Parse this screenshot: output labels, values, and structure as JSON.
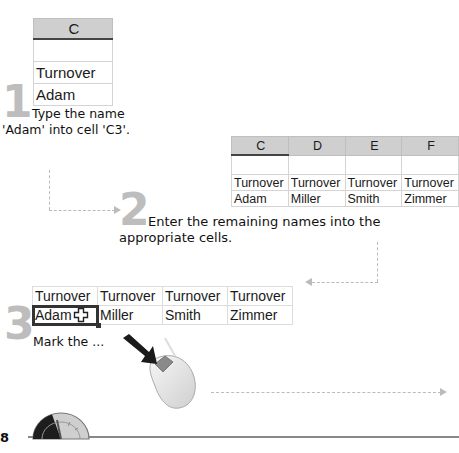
{
  "step1": {
    "number": "1",
    "sheet": {
      "column_header": "C",
      "rows": [
        "",
        "Turnover",
        "Adam"
      ]
    },
    "text_line1": "Type the name",
    "text_line2": "'Adam' into cell 'C3'."
  },
  "step2": {
    "number": "2",
    "sheet": {
      "column_headers": [
        "C",
        "D",
        "E",
        "F"
      ],
      "rows": [
        [
          "",
          "",
          "",
          ""
        ],
        [
          "Turnover",
          "Turnover",
          "Turnover",
          "Turnover"
        ],
        [
          "Adam",
          "Miller",
          "Smith",
          "Zimmer"
        ]
      ]
    },
    "text_line1": "Enter the remaining names into the",
    "text_line2": "appropriate cells."
  },
  "step3": {
    "number": "3",
    "sheet": {
      "rows": [
        [
          "Turnover",
          "Turnover",
          "Turnover",
          "Turnover"
        ],
        [
          "Adam",
          "Miller",
          "Smith",
          "Zimmer"
        ]
      ],
      "active_cell": "Adam"
    },
    "text": "Mark the ..."
  },
  "footer": {
    "page_number": "8",
    "icon": "gauge-icon"
  },
  "icons": {
    "mouse": "mouse-icon",
    "cursor": "cell-cross-cursor-icon",
    "pointer_arrow": "pointer-arrow-icon"
  }
}
